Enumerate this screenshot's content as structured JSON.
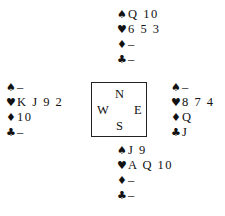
{
  "suits": {
    "spades": "♠",
    "hearts": "♥",
    "diamonds": "♦",
    "clubs": "♣"
  },
  "compass": {
    "north": "N",
    "south": "S",
    "west": "W",
    "east": "E"
  },
  "hands": {
    "north": {
      "spades": "Q 10",
      "hearts": "6 5 3",
      "diamonds": "–",
      "clubs": "–"
    },
    "west": {
      "spades": "–",
      "hearts": "K J 9 2",
      "diamonds": "10",
      "clubs": "–"
    },
    "east": {
      "spades": "–",
      "hearts": "8 7 4",
      "diamonds": "Q",
      "clubs": "J"
    },
    "south": {
      "spades": "J 9",
      "hearts": "A Q 10",
      "diamonds": "–",
      "clubs": "–"
    }
  }
}
